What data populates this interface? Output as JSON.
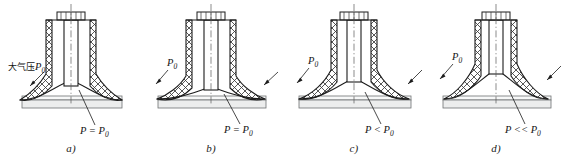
{
  "figure": {
    "panels": [
      {
        "id": "a",
        "caption": "a)",
        "outside_label": "大气压P0",
        "outside_label_main": "大气压",
        "outside_label_sym": "P",
        "outside_label_sub": "0",
        "inside_label_main": "P = P",
        "inside_label_sub": "0",
        "inside_label_full": "P = P0",
        "dome_rise": 20,
        "state": "flat-contact"
      },
      {
        "id": "b",
        "caption": "b)",
        "outside_label_sym": "P",
        "outside_label_sub": "0",
        "outside_label": "P0",
        "inside_label_main": "P = P",
        "inside_label_sub": "0",
        "inside_label_full": "P = P0",
        "dome_rise": 13,
        "state": "pressed-flat"
      },
      {
        "id": "c",
        "caption": "c)",
        "outside_label_sym": "P",
        "outside_label_sub": "0",
        "outside_label": "P0",
        "inside_label_main": "P < P",
        "inside_label_sub": "0",
        "inside_label_full": "P < P0",
        "dome_rise": 22,
        "state": "partial-vacuum"
      },
      {
        "id": "d",
        "caption": "d)",
        "outside_label_sym": "P",
        "outside_label_sub": "0",
        "outside_label": "P0",
        "inside_label_main": "P << P",
        "inside_label_sub": "0",
        "inside_label_full": "P << P0",
        "dome_rise": 31,
        "state": "strong-vacuum"
      }
    ],
    "colors": {
      "line": "#1c1c1c",
      "hatch": "#3a3a3a",
      "plate": "#eceded",
      "background": "#ffffff"
    }
  }
}
